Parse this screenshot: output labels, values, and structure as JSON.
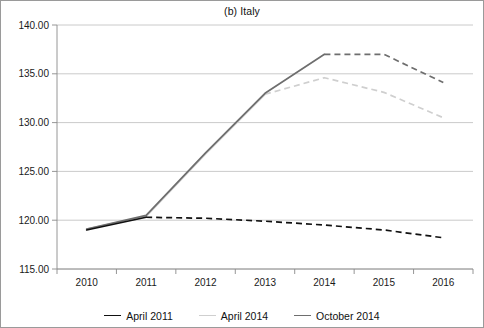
{
  "figure": {
    "title": "(b) Italy",
    "background": "#ffffff",
    "border_color": "#9a9a9a"
  },
  "chart_data": {
    "type": "line",
    "title": "(b) Italy",
    "xlabel": "",
    "ylabel": "",
    "x": [
      2010,
      2011,
      2012,
      2013,
      2014,
      2015,
      2016
    ],
    "xtick_labels": [
      "2010",
      "2011",
      "2012",
      "2013",
      "2014",
      "2015",
      "2016"
    ],
    "ytick_labels": [
      "115.00",
      "120.00",
      "125.00",
      "130.00",
      "135.00",
      "140.00"
    ],
    "yticks": [
      115,
      120,
      125,
      130,
      135,
      140
    ],
    "ylim": [
      115,
      140
    ],
    "xlim": [
      2009.6,
      2016.4
    ],
    "grid": "horizontal",
    "legend_position": "bottom-center",
    "series": [
      {
        "name": "April 2011",
        "color": "#111111",
        "values": [
          119.0,
          120.3,
          120.2,
          119.9,
          119.5,
          119.0,
          118.2
        ],
        "solid_through": 2011,
        "dashed_from": 2011
      },
      {
        "name": "April 2014",
        "color": "#cfcfcf",
        "values": [
          119.1,
          120.4,
          126.8,
          132.9,
          134.6,
          133.1,
          130.5
        ],
        "solid_through": 2013,
        "dashed_from": 2013
      },
      {
        "name": "October 2014",
        "color": "#6e6e6e",
        "values": [
          119.1,
          120.5,
          126.9,
          133.0,
          137.0,
          137.0,
          134.1
        ],
        "solid_through": 2014,
        "dashed_from": 2014
      }
    ]
  },
  "legend": {
    "items": [
      {
        "label": "April 2011",
        "color": "#111111"
      },
      {
        "label": "April 2014",
        "color": "#cfcfcf"
      },
      {
        "label": "October 2014",
        "color": "#6e6e6e"
      }
    ]
  }
}
